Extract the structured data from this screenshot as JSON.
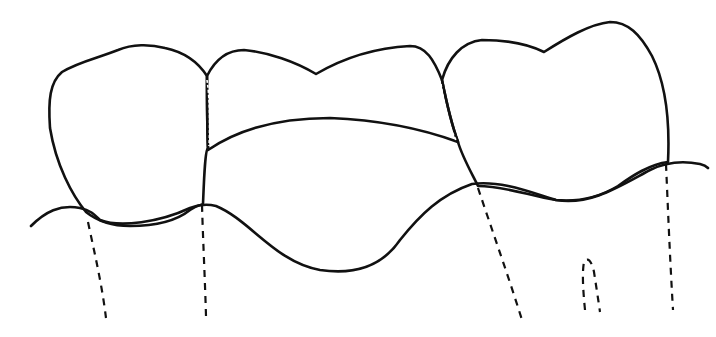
{
  "figure": {
    "caption_remnant": "",
    "colors": {
      "outline": "#111111",
      "hatch": "#444444",
      "background": "#ffffff"
    },
    "parts": [
      {
        "name": "left-abutment-crown",
        "fill": "diagonal-hatch"
      },
      {
        "name": "pontic",
        "fill": "diagonal-hatch"
      },
      {
        "name": "right-abutment-crown",
        "fill": "diagonal-hatch"
      },
      {
        "name": "gum-line",
        "style": "solid"
      },
      {
        "name": "root-outlines",
        "style": "dashed",
        "count": 5
      }
    ]
  }
}
